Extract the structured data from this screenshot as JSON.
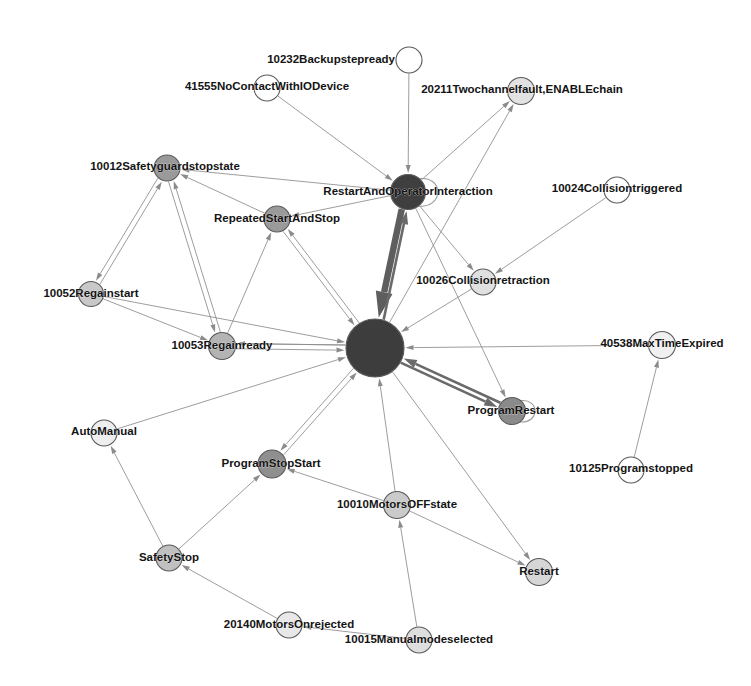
{
  "figure": {
    "type": "directed-network-graph",
    "title": "",
    "background_color": "#ffffff",
    "width": 751,
    "height": 686,
    "edge_color": "#8b8b8b",
    "node_stroke_color": "#5a5a5a"
  },
  "chart_data": {
    "type": "scatter",
    "title": "",
    "xlabel": "",
    "ylabel": "",
    "layout": "force-directed node-link diagram, labeled vertices, directed edges with arrowheads, two large dark hub nodes",
    "legend": "none",
    "grid": false,
    "nodes": [
      {
        "id": "n0",
        "label": "10232Backupstepready",
        "x": 409,
        "y": 60,
        "r": 13,
        "fill": "#ffffff",
        "label_anchor": "end",
        "label_dx": -14,
        "label_dy": 0
      },
      {
        "id": "n1",
        "label": "41555NoContactWithIODevice",
        "x": 267,
        "y": 88,
        "r": 13,
        "fill": "#ffffff",
        "label_anchor": "middle",
        "label_dx": 0,
        "label_dy": -1
      },
      {
        "id": "n2",
        "label": "20211Twochannelfault,ENABLEchain",
        "x": 521,
        "y": 91,
        "r": 13.5,
        "fill": "#e2e2e2",
        "label_anchor": "middle",
        "label_dx": 1,
        "label_dy": -1
      },
      {
        "id": "n3",
        "label": "10012Safetyguardstopstate",
        "x": 167,
        "y": 168,
        "r": 13,
        "fill": "#9a9a9a",
        "label_anchor": "middle",
        "label_dx": -2,
        "label_dy": -1
      },
      {
        "id": "n4",
        "label": "RestartAndOperatorInteraction",
        "x": 408,
        "y": 192,
        "r": 17.5,
        "fill": "#3f3f3f",
        "label_anchor": "middle",
        "label_dx": 0,
        "label_dy": 0
      },
      {
        "id": "n5",
        "label": "10024Collisiontriggered",
        "x": 617,
        "y": 190,
        "r": 13,
        "fill": "#ffffff",
        "label_anchor": "middle",
        "label_dx": 0,
        "label_dy": -1
      },
      {
        "id": "n6",
        "label": "RepeatedStartAndStop",
        "x": 277,
        "y": 219,
        "r": 13,
        "fill": "#9a9a9a",
        "label_anchor": "middle",
        "label_dx": 0,
        "label_dy": 0
      },
      {
        "id": "n7",
        "label": "10026Collisionretraction",
        "x": 483,
        "y": 282,
        "r": 13,
        "fill": "#e0e0e0",
        "label_anchor": "middle",
        "label_dx": 0,
        "label_dy": -1
      },
      {
        "id": "n8",
        "label": "10052Regainstart",
        "x": 91,
        "y": 294,
        "r": 12.5,
        "fill": "#c8c8c8",
        "label_anchor": "middle",
        "label_dx": 0,
        "label_dy": 0
      },
      {
        "id": "n9",
        "label": "40538MaxTimeExpired",
        "x": 662,
        "y": 345,
        "r": 13.5,
        "fill": "#f0f0f0",
        "label_anchor": "middle",
        "label_dx": 0,
        "label_dy": -1
      },
      {
        "id": "n10",
        "label": "10053Regainready",
        "x": 222,
        "y": 346,
        "r": 13.5,
        "fill": "#b4b4b4",
        "label_anchor": "middle",
        "label_dx": 0,
        "label_dy": 0
      },
      {
        "id": "n11",
        "label": "HUB",
        "x": 375,
        "y": 348,
        "r": 29,
        "fill": "#3d3d3d",
        "label_anchor": "middle",
        "label_dx": 0,
        "label_dy": 0,
        "hide_label": true
      },
      {
        "id": "n12",
        "label": "ProgramRestart",
        "x": 512,
        "y": 411,
        "r": 13.5,
        "fill": "#8a8a8a",
        "label_anchor": "middle",
        "label_dx": -1,
        "label_dy": 0
      },
      {
        "id": "n13",
        "label": "AutoManual",
        "x": 104,
        "y": 433,
        "r": 13,
        "fill": "#eeeeee",
        "label_anchor": "middle",
        "label_dx": 0,
        "label_dy": -1
      },
      {
        "id": "n14",
        "label": "ProgramStopStart",
        "x": 272,
        "y": 464,
        "r": 14,
        "fill": "#8f8f8f",
        "label_anchor": "middle",
        "label_dx": -1,
        "label_dy": 0
      },
      {
        "id": "n15",
        "label": "10010MotorsOFFstate",
        "x": 397,
        "y": 505,
        "r": 13.5,
        "fill": "#cacaca",
        "label_anchor": "middle",
        "label_dx": 0,
        "label_dy": 0
      },
      {
        "id": "n16",
        "label": "10125Programstopped",
        "x": 631,
        "y": 470,
        "r": 13,
        "fill": "#ffffff",
        "label_anchor": "middle",
        "label_dx": 0,
        "label_dy": -1
      },
      {
        "id": "n17",
        "label": "SafetyStop",
        "x": 169,
        "y": 558,
        "r": 13,
        "fill": "#c0c0c0",
        "label_anchor": "middle",
        "label_dx": 0,
        "label_dy": 0
      },
      {
        "id": "n18",
        "label": "Restart",
        "x": 539,
        "y": 572,
        "r": 13.5,
        "fill": "#d6d6d6",
        "label_anchor": "middle",
        "label_dx": 0,
        "label_dy": 0
      },
      {
        "id": "n19",
        "label": "20140MotorsOnrejected",
        "x": 289,
        "y": 625,
        "r": 13,
        "fill": "#e8e8e8",
        "label_anchor": "middle",
        "label_dx": 0,
        "label_dy": 0
      },
      {
        "id": "n20",
        "label": "10015Manualmodeselected",
        "x": 419,
        "y": 640,
        "r": 13,
        "fill": "#dedede",
        "label_anchor": "middle",
        "label_dx": 0,
        "label_dy": 0
      }
    ],
    "edges": [
      {
        "from": "n0",
        "to": "n4",
        "weight": "normal"
      },
      {
        "from": "n1",
        "to": "n4",
        "weight": "normal"
      },
      {
        "from": "n4",
        "to": "n2",
        "weight": "normal"
      },
      {
        "from": "n11",
        "to": "n2",
        "weight": "normal"
      },
      {
        "from": "n4",
        "to": "n3",
        "weight": "normal"
      },
      {
        "from": "n6",
        "to": "n3",
        "weight": "normal"
      },
      {
        "from": "n8",
        "to": "n3",
        "weight": "normal"
      },
      {
        "from": "n10",
        "to": "n3",
        "weight": "normal"
      },
      {
        "from": "n3",
        "to": "n8",
        "weight": "normal"
      },
      {
        "from": "n3",
        "to": "n10",
        "weight": "normal"
      },
      {
        "from": "n8",
        "to": "n10",
        "weight": "normal"
      },
      {
        "from": "n4",
        "to": "n6",
        "weight": "normal"
      },
      {
        "from": "n11",
        "to": "n6",
        "weight": "normal"
      },
      {
        "from": "n6",
        "to": "n11",
        "weight": "normal"
      },
      {
        "from": "n4",
        "to": "n11",
        "weight": "heavy"
      },
      {
        "from": "n11",
        "to": "n4",
        "weight": "thick"
      },
      {
        "from": "n5",
        "to": "n7",
        "weight": "normal"
      },
      {
        "from": "n7",
        "to": "n11",
        "weight": "normal"
      },
      {
        "from": "n4",
        "to": "n7",
        "weight": "normal"
      },
      {
        "from": "n9",
        "to": "n11",
        "weight": "normal"
      },
      {
        "from": "n10",
        "to": "n11",
        "weight": "normal"
      },
      {
        "from": "n8",
        "to": "n11",
        "weight": "normal"
      },
      {
        "from": "n11",
        "to": "n10",
        "weight": "normal"
      },
      {
        "from": "n11",
        "to": "n12",
        "weight": "thick"
      },
      {
        "from": "n12",
        "to": "n11",
        "weight": "thick"
      },
      {
        "from": "n4",
        "to": "n12",
        "weight": "normal"
      },
      {
        "from": "n13",
        "to": "n11",
        "weight": "normal"
      },
      {
        "from": "n17",
        "to": "n13",
        "weight": "normal"
      },
      {
        "from": "n11",
        "to": "n14",
        "weight": "normal"
      },
      {
        "from": "n14",
        "to": "n11",
        "weight": "normal"
      },
      {
        "from": "n15",
        "to": "n14",
        "weight": "normal"
      },
      {
        "from": "n15",
        "to": "n11",
        "weight": "normal"
      },
      {
        "from": "n15",
        "to": "n18",
        "weight": "normal"
      },
      {
        "from": "n11",
        "to": "n18",
        "weight": "normal"
      },
      {
        "from": "n16",
        "to": "n9",
        "weight": "normal"
      },
      {
        "from": "n17",
        "to": "n14",
        "weight": "normal"
      },
      {
        "from": "n19",
        "to": "n17",
        "weight": "normal"
      },
      {
        "from": "n20",
        "to": "n15",
        "weight": "normal"
      },
      {
        "from": "n20",
        "to": "n19",
        "weight": "normal"
      },
      {
        "from": "n10",
        "to": "n6",
        "weight": "normal"
      },
      {
        "from": "n11",
        "to": "n10",
        "weight": "normal"
      }
    ],
    "self_loops": [
      {
        "node": "n4"
      },
      {
        "node": "n12"
      }
    ]
  }
}
